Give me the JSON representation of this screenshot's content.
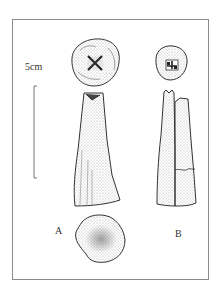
{
  "figure": {
    "scale_label": "5cm",
    "specimens": [
      {
        "id": "A",
        "label": "A",
        "views": [
          "top",
          "side",
          "base"
        ]
      },
      {
        "id": "B",
        "label": "B",
        "views": [
          "top",
          "side"
        ]
      }
    ]
  },
  "colors": {
    "frame": "#8a8a8a",
    "line": "#333333",
    "stipple": "#555555",
    "background": "#ffffff"
  }
}
